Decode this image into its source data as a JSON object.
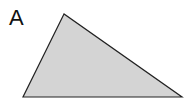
{
  "figure": {
    "label": "A",
    "shape": "triangle",
    "vertices": [
      [
        64,
        14
      ],
      [
        23,
        97
      ],
      [
        182,
        97
      ]
    ],
    "fill_color": "#d4d4d4",
    "stroke_color": "#222222",
    "stroke_width": 1.2
  }
}
